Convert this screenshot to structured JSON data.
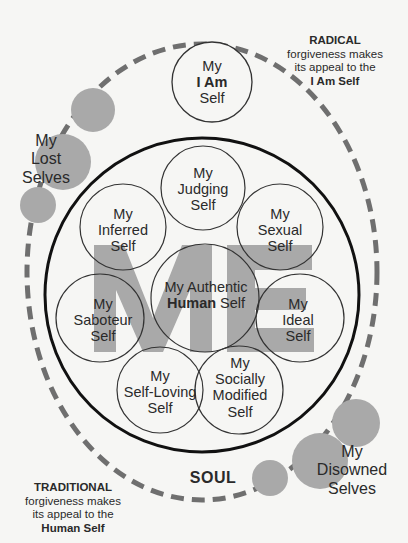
{
  "diagram": {
    "colors": {
      "background": "#f6f6f4",
      "gray_fill": "#a9a9a9",
      "dash": "#6f6f6f",
      "outline": "#111111",
      "text": "#2a2a2a"
    },
    "center_letters": "ME",
    "outer_label": "SOUL",
    "selves": {
      "i_am": {
        "line1": "My",
        "line2_bold": "I Am",
        "line3": "Self"
      },
      "judging": {
        "line1": "My",
        "line2": "Judging",
        "line3": "Self"
      },
      "inferred": {
        "line1": "My",
        "line2": "Inferred",
        "line3": "Self"
      },
      "sexual": {
        "line1": "My",
        "line2": "Sexual",
        "line3": "Self"
      },
      "authentic": {
        "line1": "My Authentic",
        "line2_bold": "Human",
        "line2_rest": " Self"
      },
      "saboteur": {
        "line1": "My",
        "line2": "Saboteur",
        "line3": "Self"
      },
      "ideal": {
        "line1": "My",
        "line2": "Ideal",
        "line3": "Self"
      },
      "self_loving": {
        "line1": "My",
        "line2": "Self-Loving",
        "line3": "Self"
      },
      "socially_modified": {
        "line1": "My",
        "line2": "Socially",
        "line3": "Modified",
        "line4": "Self"
      }
    },
    "lost_selves": {
      "line1": "My",
      "line2": "Lost",
      "line3": "Selves"
    },
    "disowned_selves": {
      "line1": "My",
      "line2": "Disowned",
      "line3": "Selves"
    },
    "radical_note": {
      "heading": "RADICAL",
      "line1": "forgiveness makes",
      "line2": "its appeal to the",
      "target": "I Am Self"
    },
    "traditional_note": {
      "heading": "TRADITIONAL",
      "line1": "forgiveness makes",
      "line2": "its appeal to the",
      "target": "Human Self"
    }
  }
}
